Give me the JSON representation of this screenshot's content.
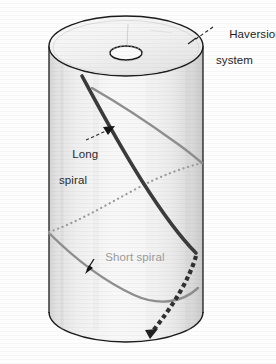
{
  "figure": {
    "kind": "anatomical-diagram",
    "width": 276,
    "height": 364,
    "background_color": "#fefefe"
  },
  "labels": {
    "haversion": {
      "line1": "Haversion",
      "line2": "system",
      "color": "#1d1d1d",
      "leader": "dashed"
    },
    "long_spiral": {
      "line1": "Long",
      "line2": "spiral",
      "color": "#2a2a2a",
      "leader": "dashed-arrow"
    },
    "short_spiral": {
      "line1": "Short spiral",
      "color": "#9a9a9a",
      "leader": "solid-arrow"
    }
  },
  "colors": {
    "outline": "#1a1a1a",
    "long_spiral": "#3a3a3a",
    "short_spiral": "#8e8e8e",
    "hidden_long_spiral": "#3a3a3a",
    "hidden_short_spiral": "#9b9b9b",
    "cylinder_light": "#f7f7f7",
    "cylinder_shade": "#d8d8d8",
    "top_face": "#f2f2f2",
    "canal_fill": "#fbfbfb"
  },
  "geometry": {
    "cylinder": {
      "top_center_x": 126,
      "top_center_y": 46,
      "radius_x": 77,
      "radius_y": 30,
      "bottom_center_y": 312,
      "bottom_bulge_y": 342
    },
    "haversian_canal": {
      "center_x": 126,
      "center_y": 53,
      "radius_x": 16,
      "radius_y": 7
    }
  },
  "elements": {
    "long_spiral_visible": "steep dark spiral from top-left rim down to right edge",
    "long_spiral_hidden": "dotted dark segment continuing behind cylinder to bottom arrowhead",
    "short_spiral_visible": "shallow grey spiral crossing front face",
    "short_spiral_hidden": "dotted grey segment behind cylinder"
  }
}
